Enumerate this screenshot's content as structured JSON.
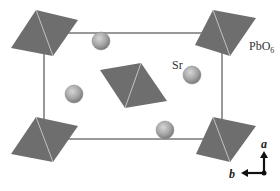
{
  "figure": {
    "title": "",
    "labels": {
      "octahedron": "PbO",
      "octahedron_subscript": "6",
      "sphere": "Sr"
    },
    "axes": {
      "vertical": "a",
      "horizontal": "b"
    },
    "colors": {
      "octahedron_fill": "#6e6e6e",
      "octahedron_edge": "#d8d8d8",
      "sphere_fill": "#a8a8a8",
      "cell_line": "#555555",
      "axis": "#111111"
    },
    "unit_cell": {
      "x": 44,
      "y": 33,
      "width": 178,
      "height": 106
    },
    "octahedra": [
      {
        "name": "top-left",
        "points": [
          [
            36,
            10
          ],
          [
            78,
            20
          ],
          [
            53,
            56
          ],
          [
            11,
            48
          ]
        ]
      },
      {
        "name": "top-right",
        "points": [
          [
            213,
            10
          ],
          [
            256,
            18
          ],
          [
            230,
            56
          ],
          [
            195,
            45
          ]
        ]
      },
      {
        "name": "center",
        "points": [
          [
            141,
            63
          ],
          [
            167,
            101
          ],
          [
            125,
            108
          ],
          [
            100,
            70
          ]
        ]
      },
      {
        "name": "bottom-left",
        "points": [
          [
            36,
            117
          ],
          [
            78,
            126
          ],
          [
            53,
            162
          ],
          [
            11,
            154
          ]
        ]
      },
      {
        "name": "bottom-right",
        "points": [
          [
            213,
            117
          ],
          [
            256,
            126
          ],
          [
            230,
            162
          ],
          [
            196,
            154
          ]
        ]
      }
    ],
    "spheres": [
      {
        "cx": 101,
        "cy": 41,
        "r": 9
      },
      {
        "cx": 74,
        "cy": 94,
        "r": 9
      },
      {
        "cx": 192,
        "cy": 75,
        "r": 9
      },
      {
        "cx": 165,
        "cy": 130,
        "r": 9
      }
    ]
  }
}
